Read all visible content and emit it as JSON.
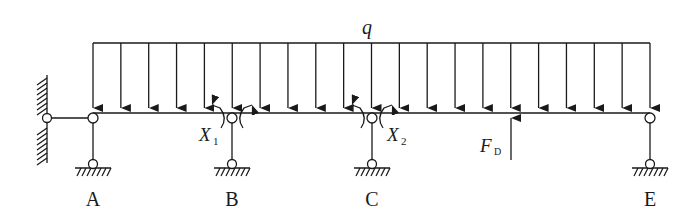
{
  "diagram": {
    "type": "continuous-beam-force-method",
    "colors": {
      "line": "#1a1a1a",
      "background": "#ffffff"
    },
    "load": {
      "label": "q",
      "kind": "uniformly-distributed",
      "x_start": 93,
      "x_end": 650,
      "arrow_count": 21
    },
    "supports": [
      {
        "id": "A",
        "label": "A",
        "x": 93
      },
      {
        "id": "B",
        "label": "B",
        "x": 232
      },
      {
        "id": "C",
        "label": "C",
        "x": 372
      },
      {
        "id": "E",
        "label": "E",
        "x": 650
      }
    ],
    "wall": {
      "x": 47,
      "label": ""
    },
    "redundants": [
      {
        "id": "X1",
        "symbol": "X",
        "subscript": "1",
        "at": "B"
      },
      {
        "id": "X2",
        "symbol": "X",
        "subscript": "2",
        "at": "C"
      }
    ],
    "point_force": {
      "symbol": "F",
      "subscript": "D",
      "x": 511,
      "direction": "up"
    }
  }
}
